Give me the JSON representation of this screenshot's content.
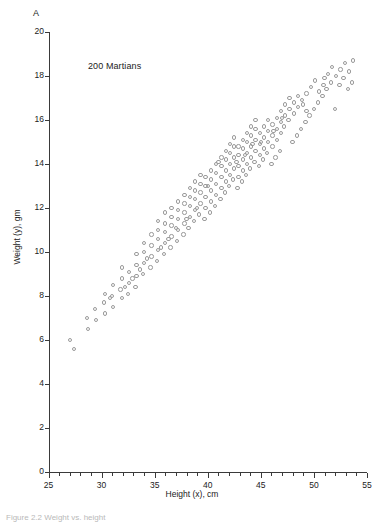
{
  "panel_letter": "A",
  "annotation": "200 Martians",
  "caption": "Figure 2.2  Weight vs. height",
  "chart_data": {
    "type": "scatter",
    "title": "",
    "annotation": "200 Martians",
    "xlabel": "Height (x), cm",
    "ylabel": "Weight (y), gm",
    "xlim": [
      25,
      55
    ],
    "ylim": [
      0,
      20
    ],
    "x_major_ticks": [
      25,
      30,
      35,
      40,
      45,
      50,
      55
    ],
    "x_minor_step": 1,
    "y_major_ticks": [
      0,
      2,
      4,
      6,
      8,
      10,
      12,
      14,
      16,
      18,
      20
    ],
    "grid": false,
    "legend": "none",
    "marker": "open-circle",
    "marker_color": "#9a9a9a",
    "n_points": 200,
    "points": [
      [
        27.0,
        6.0
      ],
      [
        27.4,
        5.6
      ],
      [
        28.6,
        7.0
      ],
      [
        28.7,
        6.5
      ],
      [
        29.4,
        7.4
      ],
      [
        29.5,
        6.9
      ],
      [
        30.2,
        7.7
      ],
      [
        30.3,
        7.2
      ],
      [
        30.3,
        8.1
      ],
      [
        31.0,
        8.0
      ],
      [
        31.1,
        7.5
      ],
      [
        31.1,
        8.5
      ],
      [
        31.8,
        8.3
      ],
      [
        31.9,
        7.9
      ],
      [
        31.9,
        8.8
      ],
      [
        31.9,
        9.3
      ],
      [
        32.5,
        8.1
      ],
      [
        32.6,
        8.6
      ],
      [
        32.6,
        9.1
      ],
      [
        33.2,
        8.4
      ],
      [
        33.3,
        8.9
      ],
      [
        33.3,
        9.4
      ],
      [
        33.3,
        9.9
      ],
      [
        33.9,
        9.0
      ],
      [
        34.0,
        9.5
      ],
      [
        34.0,
        10.0
      ],
      [
        34.0,
        10.4
      ],
      [
        34.6,
        9.3
      ],
      [
        34.7,
        9.8
      ],
      [
        34.7,
        10.3
      ],
      [
        34.7,
        10.8
      ],
      [
        35.2,
        9.6
      ],
      [
        35.3,
        10.1
      ],
      [
        35.3,
        10.6
      ],
      [
        35.3,
        11.0
      ],
      [
        35.3,
        11.4
      ],
      [
        35.9,
        9.9
      ],
      [
        36.0,
        10.4
      ],
      [
        36.0,
        10.9
      ],
      [
        36.0,
        11.3
      ],
      [
        36.0,
        11.8
      ],
      [
        36.5,
        10.2
      ],
      [
        36.6,
        10.7
      ],
      [
        36.6,
        11.2
      ],
      [
        36.6,
        11.6
      ],
      [
        36.6,
        12.0
      ],
      [
        37.1,
        10.5
      ],
      [
        37.2,
        11.0
      ],
      [
        37.2,
        11.5
      ],
      [
        37.2,
        11.9
      ],
      [
        37.2,
        12.3
      ],
      [
        37.7,
        10.8
      ],
      [
        37.8,
        11.3
      ],
      [
        37.8,
        11.8
      ],
      [
        37.8,
        12.2
      ],
      [
        37.8,
        12.6
      ],
      [
        38.2,
        11.1
      ],
      [
        38.3,
        11.6
      ],
      [
        38.3,
        12.1
      ],
      [
        38.3,
        12.5
      ],
      [
        38.3,
        12.9
      ],
      [
        38.7,
        11.4
      ],
      [
        38.8,
        11.9
      ],
      [
        38.8,
        12.4
      ],
      [
        38.8,
        12.8
      ],
      [
        38.8,
        13.2
      ],
      [
        39.2,
        11.7
      ],
      [
        39.3,
        12.2
      ],
      [
        39.3,
        12.7
      ],
      [
        39.3,
        13.1
      ],
      [
        39.3,
        13.5
      ],
      [
        39.7,
        11.5
      ],
      [
        39.8,
        12.0
      ],
      [
        39.8,
        12.5
      ],
      [
        39.8,
        13.0
      ],
      [
        39.8,
        13.4
      ],
      [
        40.2,
        11.8
      ],
      [
        40.3,
        12.3
      ],
      [
        40.3,
        12.8
      ],
      [
        40.3,
        13.3
      ],
      [
        40.3,
        13.7
      ],
      [
        40.7,
        12.1
      ],
      [
        40.8,
        12.6
      ],
      [
        40.8,
        13.1
      ],
      [
        40.8,
        13.6
      ],
      [
        40.8,
        14.0
      ],
      [
        41.2,
        12.4
      ],
      [
        41.3,
        12.9
      ],
      [
        41.3,
        13.4
      ],
      [
        41.3,
        13.9
      ],
      [
        41.3,
        14.3
      ],
      [
        41.6,
        12.7
      ],
      [
        41.7,
        13.2
      ],
      [
        41.7,
        13.7
      ],
      [
        41.7,
        14.2
      ],
      [
        41.7,
        14.6
      ],
      [
        42.0,
        13.0
      ],
      [
        42.1,
        13.5
      ],
      [
        42.1,
        14.0
      ],
      [
        42.1,
        14.5
      ],
      [
        42.1,
        14.9
      ],
      [
        42.4,
        13.3
      ],
      [
        42.5,
        13.8
      ],
      [
        42.5,
        14.3
      ],
      [
        42.5,
        14.8
      ],
      [
        42.5,
        15.2
      ],
      [
        42.8,
        12.9
      ],
      [
        42.9,
        13.4
      ],
      [
        42.9,
        13.9
      ],
      [
        42.9,
        14.4
      ],
      [
        42.9,
        14.8
      ],
      [
        43.2,
        13.2
      ],
      [
        43.3,
        13.7
      ],
      [
        43.3,
        14.2
      ],
      [
        43.3,
        14.7
      ],
      [
        43.3,
        15.1
      ],
      [
        43.6,
        13.5
      ],
      [
        43.7,
        14.0
      ],
      [
        43.7,
        14.5
      ],
      [
        43.7,
        15.0
      ],
      [
        43.7,
        15.4
      ],
      [
        44.0,
        13.8
      ],
      [
        44.1,
        14.3
      ],
      [
        44.1,
        14.8
      ],
      [
        44.1,
        15.3
      ],
      [
        44.1,
        15.7
      ],
      [
        44.4,
        14.1
      ],
      [
        44.5,
        14.6
      ],
      [
        44.5,
        15.1
      ],
      [
        44.5,
        15.6
      ],
      [
        44.5,
        16.0
      ],
      [
        44.8,
        13.9
      ],
      [
        44.9,
        14.4
      ],
      [
        44.9,
        14.9
      ],
      [
        44.9,
        15.4
      ],
      [
        45.2,
        14.2
      ],
      [
        45.3,
        14.7
      ],
      [
        45.3,
        15.2
      ],
      [
        45.3,
        15.7
      ],
      [
        45.6,
        14.5
      ],
      [
        45.7,
        15.0
      ],
      [
        45.7,
        15.5
      ],
      [
        45.7,
        16.0
      ],
      [
        46.0,
        14.0
      ],
      [
        46.1,
        14.8
      ],
      [
        46.1,
        15.3
      ],
      [
        46.1,
        15.8
      ],
      [
        46.4,
        14.3
      ],
      [
        46.5,
        15.1
      ],
      [
        46.5,
        15.6
      ],
      [
        46.5,
        16.1
      ],
      [
        46.8,
        14.6
      ],
      [
        46.9,
        15.4
      ],
      [
        46.9,
        15.9
      ],
      [
        46.9,
        16.4
      ],
      [
        47.2,
        15.7
      ],
      [
        47.3,
        16.2
      ],
      [
        47.3,
        16.7
      ],
      [
        47.6,
        16.0
      ],
      [
        47.7,
        16.5
      ],
      [
        47.7,
        17.0
      ],
      [
        48.0,
        15.0
      ],
      [
        48.1,
        16.3
      ],
      [
        48.1,
        16.8
      ],
      [
        48.4,
        15.3
      ],
      [
        48.5,
        16.6
      ],
      [
        48.5,
        17.1
      ],
      [
        48.8,
        15.6
      ],
      [
        48.9,
        16.9
      ],
      [
        49.2,
        15.9
      ],
      [
        49.3,
        16.4
      ],
      [
        49.3,
        17.2
      ],
      [
        49.6,
        16.2
      ],
      [
        49.7,
        17.5
      ],
      [
        50.0,
        16.5
      ],
      [
        50.1,
        17.8
      ],
      [
        50.4,
        16.8
      ],
      [
        50.5,
        17.3
      ],
      [
        50.8,
        17.1
      ],
      [
        50.9,
        17.6
      ],
      [
        51.2,
        17.4
      ],
      [
        51.3,
        18.1
      ],
      [
        51.6,
        17.7
      ],
      [
        51.7,
        18.4
      ],
      [
        52.0,
        16.5
      ],
      [
        52.1,
        18.0
      ],
      [
        52.4,
        17.6
      ],
      [
        52.5,
        18.3
      ],
      [
        52.8,
        17.9
      ],
      [
        52.9,
        18.6
      ],
      [
        53.2,
        17.4
      ],
      [
        53.3,
        18.2
      ],
      [
        53.6,
        17.7
      ],
      [
        53.7,
        18.7
      ],
      [
        41.0,
        14.1
      ],
      [
        40.0,
        13.0
      ],
      [
        39.0,
        12.0
      ],
      [
        38.0,
        11.5
      ],
      [
        37.0,
        11.1
      ],
      [
        36.3,
        10.6
      ],
      [
        35.6,
        10.2
      ],
      [
        34.3,
        9.7
      ],
      [
        33.6,
        9.2
      ],
      [
        32.9,
        8.8
      ],
      [
        32.2,
        8.4
      ],
      [
        30.8,
        7.9
      ],
      [
        44.2,
        14.9
      ],
      [
        43.5,
        14.4
      ],
      [
        42.7,
        14.1
      ],
      [
        46.2,
        15.5
      ],
      [
        47.0,
        16.1
      ],
      [
        45.0,
        15.0
      ],
      [
        49.0,
        16.7
      ],
      [
        51.0,
        17.9
      ]
    ]
  }
}
